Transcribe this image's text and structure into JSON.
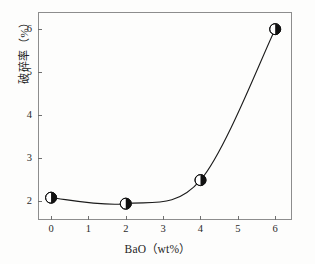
{
  "chart_data": {
    "type": "line",
    "title": "",
    "xlabel": "BaO（wt%）",
    "ylabel": "破碎率（%）",
    "x": [
      0,
      2,
      4,
      6
    ],
    "values": [
      2.07,
      1.93,
      2.48,
      6.0
    ],
    "series": [
      {
        "name": "破碎率",
        "x": [
          0,
          2,
          4,
          6
        ],
        "values": [
          2.07,
          1.93,
          2.48,
          6.0
        ]
      }
    ],
    "xlim": [
      -0.35,
      6.45
    ],
    "ylim": [
      1.55,
      6.4
    ],
    "xticks": [
      0,
      1,
      2,
      3,
      4,
      5,
      6
    ],
    "yticks": [
      2,
      3,
      4,
      5,
      6
    ],
    "xtick_labels": [
      "0",
      "1",
      "2",
      "3",
      "4",
      "5",
      "6"
    ],
    "ytick_labels": [
      "2",
      "3",
      "4",
      "5",
      "6"
    ],
    "grid": false,
    "legend": false,
    "legend_position": "none",
    "marker": "half-filled-circle",
    "marker_size": 11,
    "line_style": "smooth-spline",
    "annotations": []
  },
  "colors": {
    "line": "#1a1a1a",
    "marker_fill_left": "#ffffff",
    "marker_fill_right": "#111111",
    "marker_stroke": "#111111",
    "axis": "#8d8d8d",
    "tick": "#6f6f6f",
    "text": "#1f1f1f",
    "background": "#fdfdfc"
  },
  "axes": {
    "x_title": "BaO（wt%）",
    "y_title": "破碎率（%）"
  }
}
